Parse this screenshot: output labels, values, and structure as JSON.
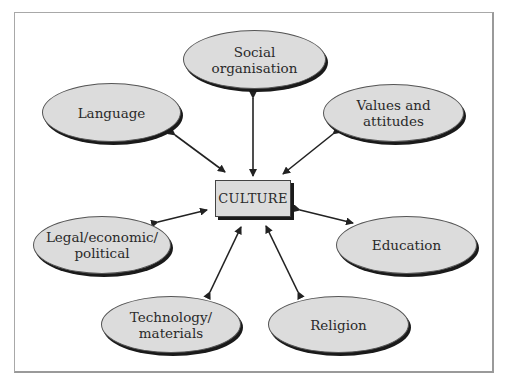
{
  "diagram": {
    "center": {
      "label": "CULTURE"
    },
    "nodes": [
      {
        "id": "social",
        "label": "Social\norganisation"
      },
      {
        "id": "language",
        "label": "Language"
      },
      {
        "id": "values",
        "label": "Values and\nattitudes"
      },
      {
        "id": "legal",
        "label": "Legal/economic/\npolitical"
      },
      {
        "id": "education",
        "label": "Education"
      },
      {
        "id": "technology",
        "label": "Technology/\nmaterials"
      },
      {
        "id": "religion",
        "label": "Religion"
      }
    ],
    "edges": [
      {
        "from": "CULTURE",
        "to": "Social organisation",
        "direction": "one-way-up-to-culture"
      },
      {
        "from": "CULTURE",
        "to": "Language",
        "direction": "bidirectional"
      },
      {
        "from": "CULTURE",
        "to": "Values and attitudes",
        "direction": "bidirectional"
      },
      {
        "from": "CULTURE",
        "to": "Legal/economic/political",
        "direction": "bidirectional"
      },
      {
        "from": "CULTURE",
        "to": "Education",
        "direction": "bidirectional"
      },
      {
        "from": "CULTURE",
        "to": "Technology/materials",
        "direction": "bidirectional"
      },
      {
        "from": "CULTURE",
        "to": "Religion",
        "direction": "bidirectional"
      }
    ],
    "colors": {
      "fill": "#dcdcdc",
      "stroke": "#222222",
      "frame": "#a8a8a8"
    }
  }
}
